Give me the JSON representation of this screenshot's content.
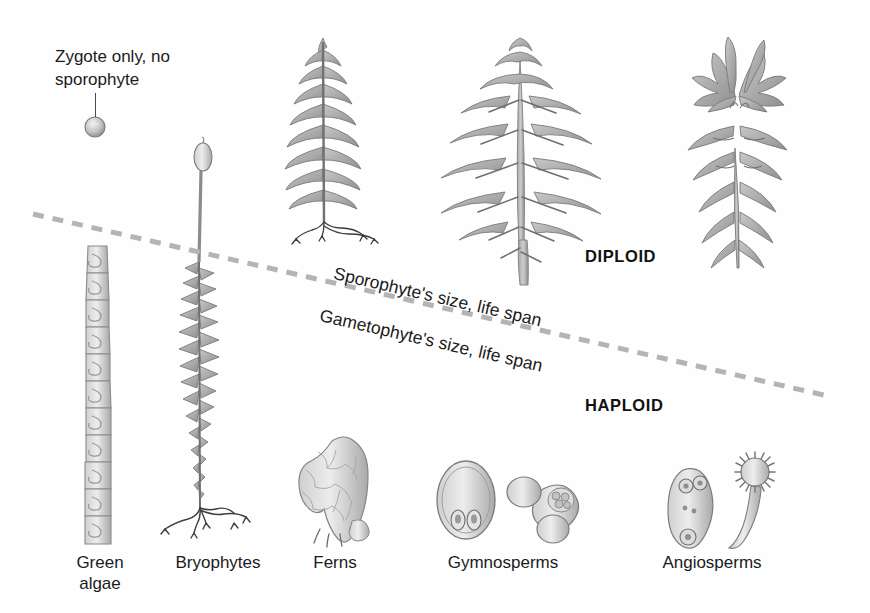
{
  "figure": {
    "title_note": "Zygote only, no sporophyte",
    "background_color": "#fefefe",
    "ink_color": "#1b1b1b"
  },
  "annotations": {
    "zygote_note": "Zygote only, no\nsporophyte",
    "diploid": "DIPLOID",
    "haploid": "HAPLOID",
    "sporophyte_axis": "Sporophyte's size, life span",
    "gametophyte_axis": "Gametophyte's size, life span"
  },
  "divider": {
    "style": "dashed",
    "color": "#b4b4b4",
    "x1": 33,
    "y1": 214,
    "x2": 828,
    "y2": 396
  },
  "groups": [
    {
      "id": "green-algae",
      "label": "Green\nalgae",
      "label_x": 62,
      "label_y": 552,
      "sporophyte": "none (zygote only)",
      "gametophyte": "filamentous chain of spiral-chloroplast cells"
    },
    {
      "id": "bryophytes",
      "label": "Bryophytes",
      "label_x": 163,
      "label_y": 552,
      "sporophyte": "capsule on slender seta",
      "gametophyte": "leafy shoot with rhizoids"
    },
    {
      "id": "ferns",
      "label": "Ferns",
      "label_x": 305,
      "label_y": 552,
      "sporophyte": "pinnate frond with roots",
      "gametophyte": "heart-shaped prothallus"
    },
    {
      "id": "gymnosperms",
      "label": "Gymnosperms",
      "label_x": 441,
      "label_y": 552,
      "sporophyte": "pine tree",
      "gametophyte": "ovule with archegonia and winged pollen grain"
    },
    {
      "id": "angiosperms",
      "label": "Angiosperms",
      "label_x": 653,
      "label_y": 552,
      "sporophyte": "flowering lily plant",
      "gametophyte": "embryo sac and pollen grain with pollen tube"
    }
  ],
  "colors": {
    "plant_fill": "#b9b9b9",
    "plant_fill_light": "#d2d2d2",
    "plant_stroke": "#7d7d7d",
    "root_dark": "#4d4d4d",
    "dash_gray": "#b4b4b4"
  }
}
